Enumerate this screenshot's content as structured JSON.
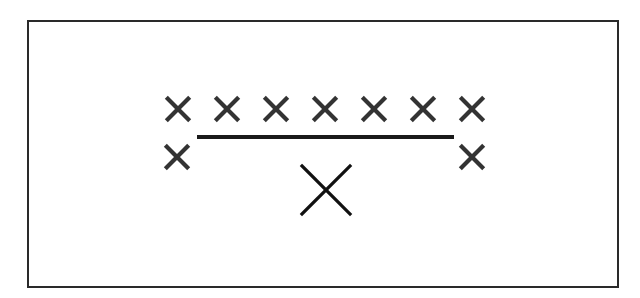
{
  "diagram": {
    "colors": {
      "frame": "#2a2a2a",
      "small_marks": "#333333",
      "line": "#1a1a1a",
      "large_mark": "#111111",
      "background": "#ffffff"
    },
    "top_row": {
      "count": 7,
      "symbol": "X",
      "y": 109,
      "x_positions": [
        178,
        227,
        276,
        325,
        374,
        423,
        472
      ],
      "size": 24
    },
    "line": {
      "x1": 197,
      "x2": 454,
      "y": 137,
      "thickness": 4
    },
    "side_marks": {
      "symbol": "X",
      "y": 157,
      "x_positions": [
        177,
        472
      ],
      "size": 24
    },
    "center_mark": {
      "symbol": "X",
      "x": 326,
      "y": 190,
      "size": 48
    }
  }
}
